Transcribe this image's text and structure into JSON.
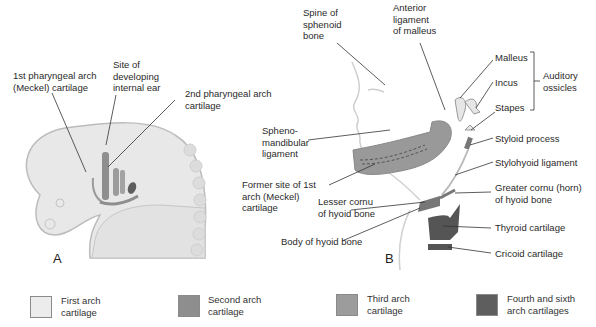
{
  "figure": {
    "panel_a": {
      "letter": "A",
      "labels": {
        "first_arch": "1st pharyngeal arch\n(Meckel) cartilage",
        "inner_ear": "Site of\ndeveloping\ninternal ear",
        "second_arch": "2nd pharyngeal arch\ncartilage"
      }
    },
    "panel_b": {
      "letter": "B",
      "labels": {
        "spine_sphenoid": "Spine of\nsphenoid\nbone",
        "ant_ligament": "Anterior\nligament\nof malleus",
        "malleus": "Malleus",
        "incus": "Incus",
        "stapes": "Stapes",
        "auditory_ossicles": "Auditory\nossicles",
        "spheno_mandibular": "Spheno-\nmandibular\nligament",
        "styloid": "Styloid process",
        "stylohyoid": "Stylohyoid ligament",
        "former_site": "Former site of 1st\narch (Meckel)\ncartilage",
        "lesser_cornu": "Lesser cornu\nof hyoid bone",
        "greater_cornu": "Greater cornu (horn)\nof hyoid bone",
        "thyroid": "Thyroid cartilage",
        "body_hyoid": "Body of hyoid bone",
        "cricoid": "Cricoid cartilage"
      }
    }
  },
  "legend": [
    {
      "label": "First arch\ncartilage",
      "color": "#ececec"
    },
    {
      "label": "Second arch\ncartilage",
      "color": "#8e8e8e"
    },
    {
      "label": "Third arch\ncartilage",
      "color": "#9c9c9c"
    },
    {
      "label": "Fourth and sixth\narch cartilages",
      "color": "#5e5e5e"
    }
  ],
  "colors": {
    "embryo": "#e6e6e6",
    "embryo_edge": "#bdbdbd",
    "second_arch": "#8e8e8e",
    "fourth_sixth": "#555555",
    "leader": "#333333"
  }
}
